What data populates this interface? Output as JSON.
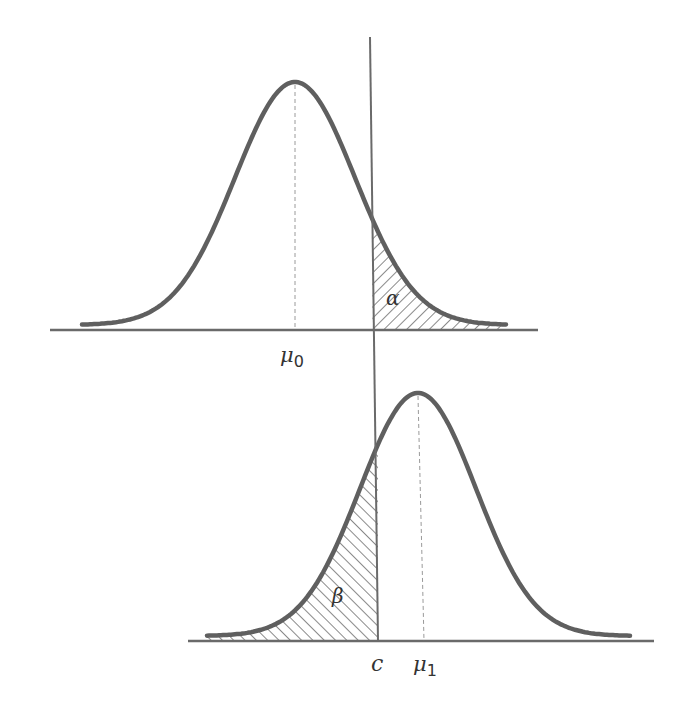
{
  "diagram": {
    "colors": {
      "curve": "#5f5f5f",
      "axis": "#6a6a6a",
      "hatch": "#8a8a8a",
      "critical_line": "#6a6a6a",
      "mean_line": "#9a9a9a",
      "text": "#333333",
      "background": "#ffffff"
    },
    "critical_line": {
      "x_top": 370,
      "y_top": 37,
      "x_bottom": 378,
      "y_bottom": 641
    },
    "top_panel": {
      "name": "null-distribution",
      "mean_label": "μ",
      "mean_sub": "0",
      "mean_x": 295,
      "sigma_px": 60,
      "baseline_y": 325,
      "peak_y": 82,
      "curve_x_range": [
        82,
        506
      ],
      "axis": {
        "x1": 50,
        "x2": 538,
        "y": 330
      },
      "shaded_region": {
        "label": "α",
        "side": "right-of-c",
        "label_x": 386,
        "label_y": 305
      },
      "mean_label_pos": {
        "x": 280,
        "y": 362
      }
    },
    "bottom_panel": {
      "name": "alternative-distribution",
      "mean_label": "μ",
      "mean_sub": "1",
      "mean_x": 418,
      "sigma_px": 58,
      "baseline_y": 636,
      "peak_y": 393,
      "curve_x_range": [
        207,
        630
      ],
      "axis": {
        "x1": 188,
        "x2": 654,
        "y": 641
      },
      "shaded_region": {
        "label": "β",
        "side": "left-of-c",
        "label_x": 332,
        "label_y": 603
      },
      "mean_label_pos": {
        "x": 413,
        "y": 671
      },
      "critical_label": "c",
      "critical_label_pos": {
        "x": 371,
        "y": 671
      }
    }
  }
}
